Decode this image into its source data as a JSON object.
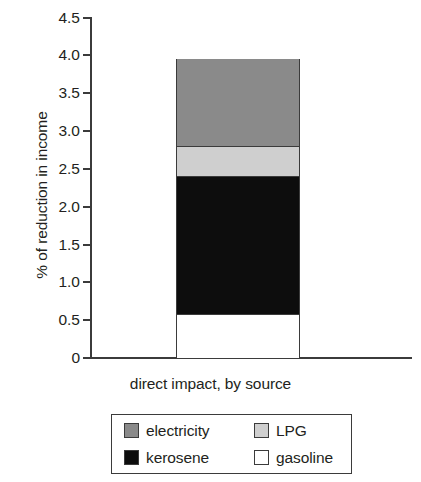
{
  "chart_data": {
    "type": "bar",
    "subtype": "stacked-bar-single-category",
    "title": "",
    "xlabel": "direct impact, by source",
    "ylabel": "% of reduction in income",
    "categories": [
      "direct impact, by source"
    ],
    "ylim": [
      0,
      4.5
    ],
    "ytick_labels": [
      "4.5",
      "4.0",
      "3.5",
      "3.0",
      "2.5",
      "2.0",
      "1.5",
      "1.0",
      "0.5",
      "0"
    ],
    "ytick_values": [
      4.5,
      4.0,
      3.5,
      3.0,
      2.5,
      2.0,
      1.5,
      1.0,
      0.5,
      0
    ],
    "grid": false,
    "legend_position": "bottom",
    "stack_order_bottom_to_top": [
      "gasoline",
      "kerosene",
      "LPG",
      "electricity"
    ],
    "series": [
      {
        "name": "gasoline",
        "values": [
          0.58
        ],
        "cumulative_top": 0.58,
        "color": "#ffffff"
      },
      {
        "name": "kerosene",
        "values": [
          1.82
        ],
        "cumulative_top": 2.4,
        "color": "#0d0d0d"
      },
      {
        "name": "LPG",
        "values": [
          0.4
        ],
        "cumulative_top": 2.8,
        "color": "#cfcfcf"
      },
      {
        "name": "electricity",
        "values": [
          1.15
        ],
        "cumulative_top": 3.95,
        "color": "#8a8a8a"
      }
    ],
    "total": 3.95
  },
  "axes": {
    "y_title": "% of reduction in income",
    "x_title": "direct impact, by source",
    "ticks": [
      {
        "label": "4.5",
        "value": 4.5
      },
      {
        "label": "4.0",
        "value": 4.0
      },
      {
        "label": "3.5",
        "value": 3.5
      },
      {
        "label": "3.0",
        "value": 3.0
      },
      {
        "label": "2.5",
        "value": 2.5
      },
      {
        "label": "2.0",
        "value": 2.0
      },
      {
        "label": "1.5",
        "value": 1.5
      },
      {
        "label": "1.0",
        "value": 1.0
      },
      {
        "label": "0.5",
        "value": 0.5
      },
      {
        "label": "0",
        "value": 0
      }
    ]
  },
  "legend": {
    "entries": [
      {
        "label": "electricity",
        "color": "#8a8a8a"
      },
      {
        "label": "LPG",
        "color": "#cfcfcf"
      },
      {
        "label": "kerosene",
        "color": "#0d0d0d"
      },
      {
        "label": "gasoline",
        "color": "#ffffff"
      }
    ]
  },
  "colors": {
    "axis": "#3b3b3b",
    "text": "#231f20",
    "background": "#ffffff"
  }
}
